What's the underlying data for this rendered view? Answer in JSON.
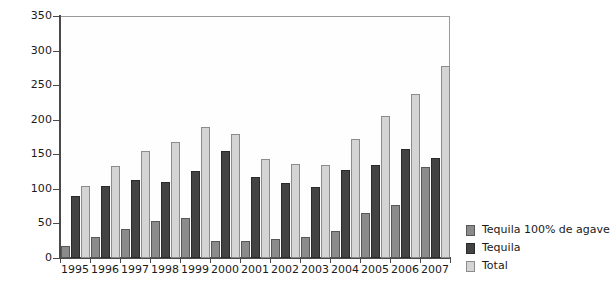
{
  "chart_data": {
    "type": "bar",
    "title": "",
    "subtitle": "",
    "xlabel": "",
    "ylabel": "",
    "ylim": [
      0,
      350
    ],
    "ytick_step": 50,
    "yticks": [
      0,
      50,
      100,
      150,
      200,
      250,
      300,
      350
    ],
    "grid": false,
    "legend_position": "right",
    "categories": [
      "1995",
      "1996",
      "1997",
      "1998",
      "1999",
      "2000",
      "2001",
      "2002",
      "2003",
      "2004",
      "2005",
      "2006",
      "2007"
    ],
    "series": [
      {
        "name": "Tequila 100% de agave",
        "color": "#8b8b8b",
        "values": [
          17,
          30,
          42,
          54,
          58,
          24,
          24,
          27,
          30,
          39,
          65,
          76,
          131
        ]
      },
      {
        "name": "Tequila",
        "color": "#434343",
        "values": [
          89,
          104,
          113,
          110,
          126,
          155,
          117,
          108,
          102,
          128,
          135,
          157,
          144
        ]
      },
      {
        "name": "Total",
        "color": "#d4d4d4",
        "values": [
          104,
          133,
          155,
          168,
          190,
          179,
          143,
          136,
          135,
          172,
          205,
          237,
          278
        ]
      }
    ]
  },
  "legend": {
    "items": [
      {
        "label": "Tequila 100% de agave"
      },
      {
        "label": "Tequila"
      },
      {
        "label": "Total"
      }
    ]
  },
  "colors": {
    "series_100_agave": "#8b8b8b",
    "series_tequila": "#434343",
    "series_total": "#d4d4d4",
    "axis": "#4a4a4a",
    "plot_border": "#9a9a9a",
    "background": "#ffffff"
  }
}
